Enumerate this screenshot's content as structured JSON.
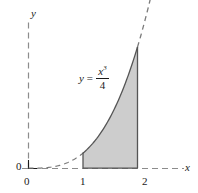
{
  "figure": {
    "kind": "function-plot-with-shaded-area",
    "background_color": "#ffffff",
    "ink_color": "#1a1a1a",
    "axis_color": "#8c8c8c",
    "curve_color": "#4d4d4d",
    "shade_fill": "#cdcdcd",
    "shade_stroke": "#6e6e6e"
  },
  "axes": {
    "y_axis_label": "y",
    "x_axis_label": "x",
    "y_origin_label": "0",
    "x_origin_label": "0",
    "x_ticks": [
      "1",
      "2"
    ],
    "style": "dashed"
  },
  "equation": {
    "lhs": "y",
    "equals": "=",
    "numerator": "x",
    "numerator_exponent": "3",
    "denominator": "4",
    "plain": "y = x^3 / 4"
  },
  "chart_data": {
    "type": "line",
    "title": "",
    "xlabel": "x",
    "ylabel": "y",
    "function": "y = x^3/4",
    "xlim": [
      0,
      2.35
    ],
    "ylim": [
      0,
      2.75
    ],
    "grid": false,
    "legend": null,
    "series": [
      {
        "name": "y = x^3/4",
        "x": [
          0.0,
          0.1,
          0.2,
          0.3,
          0.4,
          0.5,
          0.6,
          0.7,
          0.8,
          0.9,
          1.0,
          1.1,
          1.2,
          1.3,
          1.4,
          1.5,
          1.6,
          1.7,
          1.8,
          1.9,
          2.0,
          2.1,
          2.2,
          2.3
        ],
        "y": [
          0.0,
          0.0003,
          0.002,
          0.0068,
          0.016,
          0.031,
          0.054,
          0.086,
          0.128,
          0.182,
          0.25,
          0.333,
          0.432,
          0.549,
          0.686,
          0.844,
          1.024,
          1.228,
          1.458,
          1.715,
          2.0,
          2.315,
          2.662,
          3.042
        ],
        "dash_segments": [
          {
            "from": 0.0,
            "to": 1.0,
            "style": "dashed"
          },
          {
            "from": 1.0,
            "to": 2.0,
            "style": "solid"
          },
          {
            "from": 2.0,
            "to": 2.3,
            "style": "dashed"
          }
        ]
      }
    ],
    "shaded_region": {
      "label": "area under curve",
      "x_from": 1,
      "x_to": 2,
      "y_at_x_from": 0.25,
      "y_at_x_to": 2.0,
      "fill": "#cdcdcd"
    },
    "annotations": [
      {
        "text": "y = x^3/4",
        "x": 1.35,
        "y": 1.55
      }
    ],
    "xticks": [
      1,
      2
    ],
    "xticklabels": [
      "1",
      "2"
    ]
  }
}
